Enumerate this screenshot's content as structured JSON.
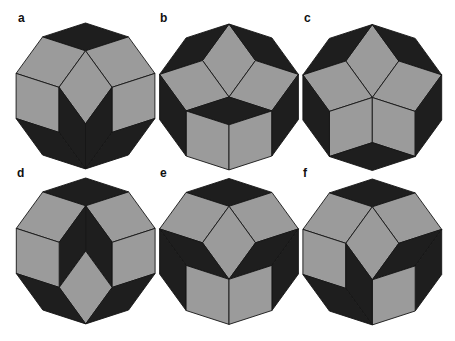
{
  "figure": {
    "colors": {
      "fat_rhombus": "#9b9b9b",
      "thin_rhombus": "#1e1e1e",
      "edge": "#151515",
      "background": "#ffffff"
    },
    "edge_length": 45.1,
    "decagon_radius": 73,
    "edge_vectors_deg": [
      18,
      54,
      90,
      126,
      162
    ],
    "panels": [
      {
        "label": "a",
        "label_pos": [
          18,
          22
        ],
        "center": [
          85.5,
          96
        ],
        "rhombi": [
          {
            "base": [
              0,
              -73
            ],
            "v": [
              0,
              4
            ]
          },
          {
            "base": [
              -42.9,
              -59.1
            ],
            "v": [
              3,
              0
            ]
          },
          {
            "base": [
              42.9,
              -59.1
            ],
            "v": [
              1,
              4
            ]
          },
          {
            "base": [
              0,
              -45.2
            ],
            "v": [
              3,
              1
            ]
          },
          {
            "base": [
              -69.4,
              -22.6
            ],
            "v": [
              2,
              0
            ]
          },
          {
            "base": [
              69.4,
              -22.6
            ],
            "v": [
              2,
              4
            ]
          },
          {
            "base": [
              -26.5,
              -8.7
            ],
            "v": [
              1,
              2
            ]
          },
          {
            "base": [
              26.5,
              -8.7
            ],
            "v": [
              3,
              2
            ]
          },
          {
            "base": [
              -69.4,
              22.5
            ],
            "v": [
              0,
              1
            ]
          },
          {
            "base": [
              69.4,
              22.5
            ],
            "v": [
              4,
              3
            ]
          }
        ]
      },
      {
        "label": "b",
        "label_pos": [
          160,
          22
        ],
        "center": [
          229,
          97
        ],
        "rhombi": [
          {
            "base": [
              0,
              -73
            ],
            "v": [
              1,
              3
            ]
          },
          {
            "base": [
              0,
              -73
            ],
            "v": [
              3,
              4
            ]
          },
          {
            "base": [
              0,
              -73
            ],
            "v": [
              0,
              1
            ]
          },
          {
            "base": [
              -26.5,
              -36.5
            ],
            "v": [
              4,
              1
            ]
          },
          {
            "base": [
              26.5,
              -36.5
            ],
            "v": [
              0,
              3
            ]
          },
          {
            "base": [
              0,
              0
            ],
            "v": [
              4,
              0
            ]
          },
          {
            "base": [
              -42.9,
              13.9
            ],
            "v": [
              0,
              2
            ]
          },
          {
            "base": [
              42.9,
              13.9
            ],
            "v": [
              4,
              2
            ]
          },
          {
            "base": [
              -69.4,
              -22.6
            ],
            "v": [
              1,
              2
            ]
          },
          {
            "base": [
              69.4,
              -22.6
            ],
            "v": [
              3,
              2
            ]
          }
        ]
      },
      {
        "label": "c",
        "label_pos": [
          304,
          22
        ],
        "center": [
          372.3,
          97.5
        ],
        "rhombi": [
          {
            "base": [
              0,
              -73
            ],
            "v": [
              1,
              3
            ]
          },
          {
            "base": [
              0,
              -73
            ],
            "v": [
              3,
              4
            ]
          },
          {
            "base": [
              0,
              -73
            ],
            "v": [
              0,
              1
            ]
          },
          {
            "base": [
              -26.5,
              -36.5
            ],
            "v": [
              4,
              1
            ]
          },
          {
            "base": [
              26.5,
              -36.5
            ],
            "v": [
              0,
              3
            ]
          },
          {
            "base": [
              0,
              0
            ],
            "v": [
              4,
              2
            ]
          },
          {
            "base": [
              0,
              0
            ],
            "v": [
              0,
              2
            ]
          },
          {
            "base": [
              -69.4,
              -22.6
            ],
            "v": [
              1,
              2
            ]
          },
          {
            "base": [
              69.4,
              -22.6
            ],
            "v": [
              3,
              2
            ]
          },
          {
            "base": [
              0,
              45.1
            ],
            "v": [
              4,
              0
            ]
          }
        ]
      },
      {
        "label": "d",
        "label_pos": [
          17,
          177
        ],
        "center": [
          85.7,
          251
        ],
        "rhombi": [
          {
            "base": [
              0,
              -73
            ],
            "v": [
              0,
              4
            ]
          },
          {
            "base": [
              -42.9,
              -59.1
            ],
            "v": [
              3,
              0
            ]
          },
          {
            "base": [
              42.9,
              -59.1
            ],
            "v": [
              1,
              4
            ]
          },
          {
            "base": [
              0,
              -45.2
            ],
            "v": [
              3,
              2
            ]
          },
          {
            "base": [
              0,
              -45.2
            ],
            "v": [
              1,
              2
            ]
          },
          {
            "base": [
              0,
              0
            ],
            "v": [
              3,
              1
            ]
          },
          {
            "base": [
              -69.4,
              -22.6
            ],
            "v": [
              2,
              0
            ]
          },
          {
            "base": [
              69.4,
              -22.6
            ],
            "v": [
              2,
              4
            ]
          },
          {
            "base": [
              -69.4,
              22.5
            ],
            "v": [
              0,
              1
            ]
          },
          {
            "base": [
              69.4,
              22.5
            ],
            "v": [
              4,
              3
            ]
          }
        ]
      },
      {
        "label": "e",
        "label_pos": [
          160,
          177
        ],
        "center": [
          229,
          251.5
        ],
        "rhombi": [
          {
            "base": [
              0,
              -73
            ],
            "v": [
              0,
              4
            ]
          },
          {
            "base": [
              -42.9,
              -59.1
            ],
            "v": [
              3,
              0
            ]
          },
          {
            "base": [
              42.9,
              -59.1
            ],
            "v": [
              1,
              4
            ]
          },
          {
            "base": [
              0,
              -45.2
            ],
            "v": [
              3,
              1
            ]
          },
          {
            "base": [
              -69.4,
              -22.6
            ],
            "v": [
              0,
              1
            ]
          },
          {
            "base": [
              69.4,
              -22.6
            ],
            "v": [
              4,
              3
            ]
          },
          {
            "base": [
              -69.4,
              -22.6
            ],
            "v": [
              1,
              2
            ]
          },
          {
            "base": [
              69.4,
              -22.6
            ],
            "v": [
              3,
              2
            ]
          },
          {
            "base": [
              -42.9,
              13.9
            ],
            "v": [
              0,
              2
            ]
          },
          {
            "base": [
              42.9,
              13.9
            ],
            "v": [
              4,
              2
            ]
          }
        ]
      },
      {
        "label": "f",
        "label_pos": [
          303,
          177
        ],
        "center": [
          372.3,
          252
        ],
        "rhombi": [
          {
            "base": [
              0,
              -73
            ],
            "v": [
              0,
              4
            ]
          },
          {
            "base": [
              -42.9,
              -59.1
            ],
            "v": [
              3,
              0
            ]
          },
          {
            "base": [
              42.9,
              -59.1
            ],
            "v": [
              1,
              4
            ]
          },
          {
            "base": [
              0,
              -45.2
            ],
            "v": [
              3,
              1
            ]
          },
          {
            "base": [
              -69.4,
              -22.6
            ],
            "v": [
              2,
              0
            ]
          },
          {
            "base": [
              69.4,
              -22.6
            ],
            "v": [
              4,
              3
            ]
          },
          {
            "base": [
              69.4,
              -22.6
            ],
            "v": [
              3,
              2
            ]
          },
          {
            "base": [
              42.9,
              13.9
            ],
            "v": [
              4,
              2
            ]
          },
          {
            "base": [
              -26.5,
              -8.7
            ],
            "v": [
              1,
              2
            ]
          },
          {
            "base": [
              -69.4,
              22.5
            ],
            "v": [
              0,
              1
            ]
          }
        ]
      }
    ]
  }
}
